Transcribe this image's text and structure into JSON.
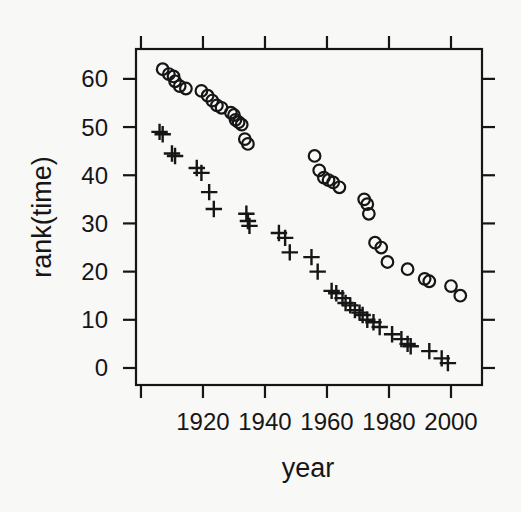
{
  "figure": {
    "background": "#f8f8f7",
    "ink": "#161616"
  },
  "chart_data": {
    "type": "scatter",
    "title": "",
    "xlabel": "year",
    "ylabel": "rank(time)",
    "xlim": [
      1898.4,
      2010.0
    ],
    "ylim": [
      -3.53,
      66.2
    ],
    "x_ticks": [
      1900,
      1920,
      1940,
      1960,
      1980,
      2000
    ],
    "x_tick_labels": [
      "",
      "1920",
      "1940",
      "1960",
      "1980",
      "2000"
    ],
    "y_ticks": [
      0,
      10,
      20,
      30,
      40,
      50,
      60
    ],
    "y_tick_labels": [
      "0",
      "10",
      "20",
      "30",
      "40",
      "50",
      "60"
    ],
    "grid": false,
    "legend": "none",
    "boxed_frame": true,
    "mirrored_ticks": true,
    "series": [
      {
        "name": "circle-series",
        "marker": "circle",
        "points": [
          [
            1907,
            62
          ],
          [
            1909,
            61
          ],
          [
            1910.5,
            60.5
          ],
          [
            1911,
            59.5
          ],
          [
            1912.5,
            58.5
          ],
          [
            1914.5,
            58
          ],
          [
            1919.5,
            57.5
          ],
          [
            1921.5,
            56.5
          ],
          [
            1923,
            55.5
          ],
          [
            1924.5,
            54.5
          ],
          [
            1926,
            54
          ],
          [
            1929,
            53
          ],
          [
            1930,
            52.5
          ],
          [
            1930.5,
            51.5
          ],
          [
            1931.5,
            51
          ],
          [
            1932.5,
            50.5
          ],
          [
            1933.5,
            47.5
          ],
          [
            1934.5,
            46.5
          ],
          [
            1956,
            44
          ],
          [
            1957.5,
            41
          ],
          [
            1959,
            39.5
          ],
          [
            1960.5,
            39
          ],
          [
            1962,
            38.5
          ],
          [
            1964,
            37.5
          ],
          [
            1972,
            35
          ],
          [
            1973,
            34
          ],
          [
            1973.5,
            32
          ],
          [
            1975.5,
            26
          ],
          [
            1977.5,
            25
          ],
          [
            1979.5,
            22
          ],
          [
            1986,
            20.5
          ],
          [
            1991.5,
            18.5
          ],
          [
            1993,
            18
          ],
          [
            2000,
            17
          ],
          [
            2003,
            15
          ]
        ]
      },
      {
        "name": "plus-series",
        "marker": "plus",
        "points": [
          [
            1906,
            49
          ],
          [
            1907,
            48.5
          ],
          [
            1910,
            44.5
          ],
          [
            1911,
            44
          ],
          [
            1918,
            41.5
          ],
          [
            1919.5,
            40.5
          ],
          [
            1922,
            36.5
          ],
          [
            1923.5,
            33
          ],
          [
            1934,
            32
          ],
          [
            1934.5,
            30.5
          ],
          [
            1935,
            29.5
          ],
          [
            1944.5,
            28
          ],
          [
            1946.5,
            27
          ],
          [
            1948,
            24
          ],
          [
            1955,
            23
          ],
          [
            1957,
            20
          ],
          [
            1961.5,
            16
          ],
          [
            1963,
            15.5
          ],
          [
            1965,
            14.5
          ],
          [
            1966,
            13.5
          ],
          [
            1967.5,
            13
          ],
          [
            1969,
            12
          ],
          [
            1970.5,
            11.5
          ],
          [
            1971.5,
            11
          ],
          [
            1973,
            10
          ],
          [
            1975,
            9.5
          ],
          [
            1977,
            8.5
          ],
          [
            1981,
            7
          ],
          [
            1984,
            6
          ],
          [
            1986,
            5
          ],
          [
            1987,
            4.5
          ],
          [
            1993,
            3.5
          ],
          [
            1997,
            2
          ],
          [
            1999,
            1
          ]
        ]
      }
    ]
  }
}
